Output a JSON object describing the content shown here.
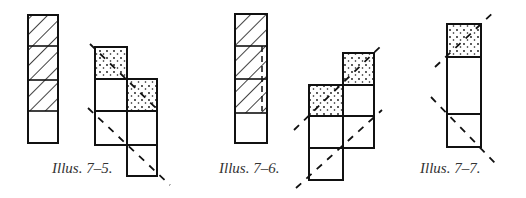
{
  "illustrations": [
    {
      "id": "7-5",
      "caption": "Illus. 7–5."
    },
    {
      "id": "7-6",
      "caption": "Illus. 7–6."
    },
    {
      "id": "7-7",
      "caption": "Illus. 7–7."
    }
  ],
  "colors": {
    "stroke": "#111111",
    "caption": "#333333",
    "background": "#ffffff"
  }
}
